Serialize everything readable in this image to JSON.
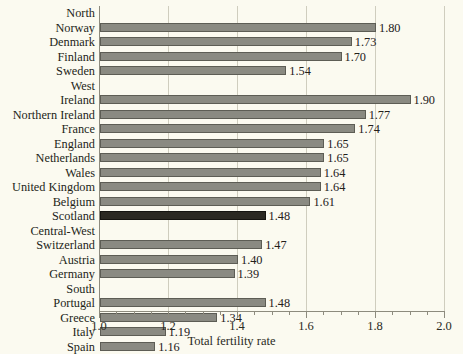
{
  "chart_data": {
    "type": "bar",
    "orientation": "horizontal",
    "title": "",
    "xlabel": "Total fertility rate",
    "ylabel": "",
    "xlim": [
      1.0,
      2.0
    ],
    "xticks": [
      1.0,
      1.2,
      1.4,
      1.6,
      1.8,
      2.0
    ],
    "xtick_labels": [
      "1.0",
      "1.2",
      "1.4",
      "1.6",
      "1.8",
      "2.0"
    ],
    "minor_tick_step": 0.05,
    "grid": "vertical-major",
    "legend": "none",
    "bar_color": "#8a8a82",
    "highlight_color": "#2b2922",
    "background_color": "#fbfaf0",
    "highlighted_category": "Scotland",
    "categories": [
      "Norway",
      "Denmark",
      "Finland",
      "Sweden",
      "Ireland",
      "Northern Ireland",
      "France",
      "England",
      "Netherlands",
      "Wales",
      "United Kingdom",
      "Belgium",
      "Scotland",
      "Switzerland",
      "Austria",
      "Germany",
      "Portugal",
      "Greece",
      "Italy",
      "Spain"
    ],
    "values": [
      1.8,
      1.73,
      1.7,
      1.54,
      1.9,
      1.77,
      1.74,
      1.65,
      1.65,
      1.64,
      1.64,
      1.61,
      1.48,
      1.47,
      1.4,
      1.39,
      1.48,
      1.34,
      1.19,
      1.16
    ],
    "groups": [
      {
        "name": "North",
        "rows": [
          {
            "label": "Norway",
            "value": 1.8,
            "display": "1.80",
            "highlight": false
          },
          {
            "label": "Denmark",
            "value": 1.73,
            "display": "1.73",
            "highlight": false
          },
          {
            "label": "Finland",
            "value": 1.7,
            "display": "1.70",
            "highlight": false
          },
          {
            "label": "Sweden",
            "value": 1.54,
            "display": "1.54",
            "highlight": false
          }
        ]
      },
      {
        "name": "West",
        "rows": [
          {
            "label": "Ireland",
            "value": 1.9,
            "display": "1.90",
            "highlight": false
          },
          {
            "label": "Northern Ireland",
            "value": 1.77,
            "display": "1.77",
            "highlight": false
          },
          {
            "label": "France",
            "value": 1.74,
            "display": "1.74",
            "highlight": false
          },
          {
            "label": "England",
            "value": 1.65,
            "display": "1.65",
            "highlight": false
          },
          {
            "label": "Netherlands",
            "value": 1.65,
            "display": "1.65",
            "highlight": false
          },
          {
            "label": "Wales",
            "value": 1.64,
            "display": "1.64",
            "highlight": false
          },
          {
            "label": "United Kingdom",
            "value": 1.64,
            "display": "1.64",
            "highlight": false
          },
          {
            "label": "Belgium",
            "value": 1.61,
            "display": "1.61",
            "highlight": false
          },
          {
            "label": "Scotland",
            "value": 1.48,
            "display": "1.48",
            "highlight": true
          }
        ]
      },
      {
        "name": "Central-West",
        "rows": [
          {
            "label": "Switzerland",
            "value": 1.47,
            "display": "1.47",
            "highlight": false
          },
          {
            "label": "Austria",
            "value": 1.4,
            "display": "1.40",
            "highlight": false
          },
          {
            "label": "Germany",
            "value": 1.39,
            "display": "1.39",
            "highlight": false
          }
        ]
      },
      {
        "name": "South",
        "rows": [
          {
            "label": "Portugal",
            "value": 1.48,
            "display": "1.48",
            "highlight": false
          },
          {
            "label": "Greece",
            "value": 1.34,
            "display": "1.34",
            "highlight": false
          },
          {
            "label": "Italy",
            "value": 1.19,
            "display": "1.19",
            "highlight": false
          },
          {
            "label": "Spain",
            "value": 1.16,
            "display": "1.16",
            "highlight": false
          }
        ]
      }
    ]
  }
}
